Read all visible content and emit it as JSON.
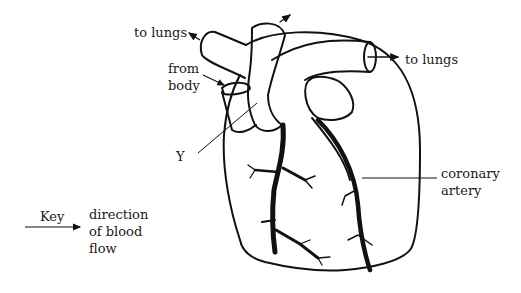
{
  "diagram": {
    "labels": {
      "to_lungs_left": "to lungs",
      "to_lungs_right": "to lungs",
      "from_body": "from\nbody",
      "y_label": "Y",
      "coronary_artery": "coronary\nartery"
    },
    "key": {
      "title": "Key",
      "description": "direction\nof blood\nflow"
    },
    "colors": {
      "line": "#111111",
      "background": "#ffffff"
    }
  }
}
